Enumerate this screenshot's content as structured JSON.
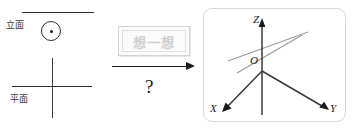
{
  "diagram": {
    "type": "orthographic-to-3d-projection",
    "left_view": {
      "elevation_label": "立面",
      "plan_label": "平面",
      "elevation_marker": "circle-with-center-dot",
      "plan_marker": "cross-lines"
    },
    "middle": {
      "stamp_text": "想一想",
      "arrow": "right-arrow",
      "question": "?"
    },
    "right_view": {
      "axes": [
        {
          "name": "Z",
          "label": "Z",
          "direction": "up"
        },
        {
          "name": "X",
          "label": "X",
          "direction": "down-left"
        },
        {
          "name": "Y",
          "label": "Y",
          "direction": "down-right"
        }
      ],
      "origin_label": "O",
      "guide_lines": 2
    }
  },
  "colors": {
    "ink": "#1a1a1a",
    "rule": "#2b2b2b",
    "guide": "#9a9a9a",
    "panel_border": "#d8d8d8",
    "watermark": "#cfcfcf"
  }
}
